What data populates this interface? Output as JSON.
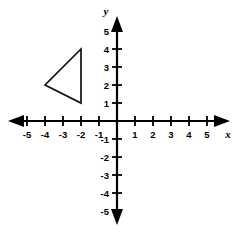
{
  "canvas": {
    "width": 238,
    "height": 233,
    "background": "#ffffff"
  },
  "axis_names": {
    "x": "x",
    "y": "y"
  },
  "chart_data": {
    "type": "scatter",
    "title": "",
    "subtitle": "",
    "xlabel": "x",
    "ylabel": "y",
    "xlim": [
      -5.8,
      5.8
    ],
    "ylim": [
      -5.8,
      5.8
    ],
    "grid": false,
    "legend": null,
    "axis_color": "#000000",
    "shape_color": "#111111",
    "x_ticks": [
      -5,
      -4,
      -3,
      -2,
      -1,
      1,
      2,
      3,
      4,
      5
    ],
    "y_ticks": [
      5,
      4,
      3,
      2,
      1,
      -1,
      -2,
      -3,
      -4,
      -5
    ],
    "x_tick_labels": [
      "-5",
      "-4",
      "-3",
      "-2",
      "-1",
      "1",
      "2",
      "3",
      "4",
      "5"
    ],
    "y_tick_labels": [
      "5",
      "4",
      "3",
      "2",
      "1",
      "-1",
      "-2",
      "-3",
      "-4",
      "-5"
    ],
    "tick_spacing_px": 18,
    "origin_px": [
      117,
      121
    ],
    "annotations": [
      {
        "name": "triangle",
        "type": "polygon",
        "closed": true,
        "fill": "none",
        "stroke": "#111111",
        "vertices": [
          [
            -2,
            4
          ],
          [
            -4,
            2
          ],
          [
            -2,
            1
          ]
        ]
      }
    ]
  }
}
